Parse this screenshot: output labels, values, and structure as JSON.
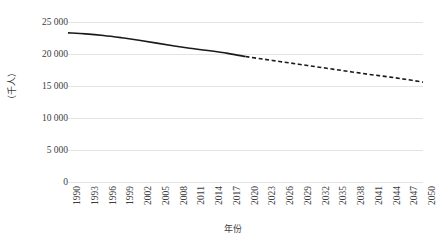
{
  "chart_data": {
    "type": "line",
    "title": "",
    "subtitle": "",
    "xlabel": "年份",
    "ylabel": "（千人）",
    "ylim": [
      0,
      25000
    ],
    "yticks": [
      0,
      5000,
      10000,
      15000,
      20000,
      25000
    ],
    "ytick_labels": [
      "0",
      "5 000",
      "10 000",
      "15 000",
      "20 000",
      "25 000"
    ],
    "xlim": [
      1990,
      2050
    ],
    "xticks": [
      1990,
      1993,
      1996,
      1999,
      2002,
      2005,
      2008,
      2011,
      2014,
      2017,
      2020,
      2023,
      2026,
      2029,
      2032,
      2035,
      2038,
      2041,
      2044,
      2047,
      2050
    ],
    "xtick_labels": [
      "1990",
      "1993",
      "1996",
      "1999",
      "2002",
      "2005",
      "2008",
      "2011",
      "2014",
      "2017",
      "2020",
      "2023",
      "2026",
      "2029",
      "2032",
      "2035",
      "2038",
      "2041",
      "2044",
      "2047",
      "2050"
    ],
    "grid": true,
    "grid_axis": "y",
    "legend": false,
    "legend_position": "none",
    "line_color": "#1a1a1a",
    "grid_color": "#e3e3e3",
    "series": [
      {
        "name": "historical",
        "style": "solid",
        "x": [
          1990,
          1993,
          1996,
          1999,
          2002,
          2005,
          2008,
          2011,
          2014,
          2017,
          2020
        ],
        "values": [
          23300,
          23150,
          22900,
          22550,
          22150,
          21700,
          21250,
          20850,
          20500,
          20100,
          19600
        ]
      },
      {
        "name": "projection",
        "style": "dashed",
        "x": [
          2020,
          2023,
          2026,
          2029,
          2032,
          2035,
          2038,
          2041,
          2044,
          2047,
          2050
        ],
        "values": [
          19600,
          19200,
          18800,
          18400,
          18000,
          17600,
          17200,
          16800,
          16450,
          16050,
          15600
        ]
      }
    ]
  }
}
